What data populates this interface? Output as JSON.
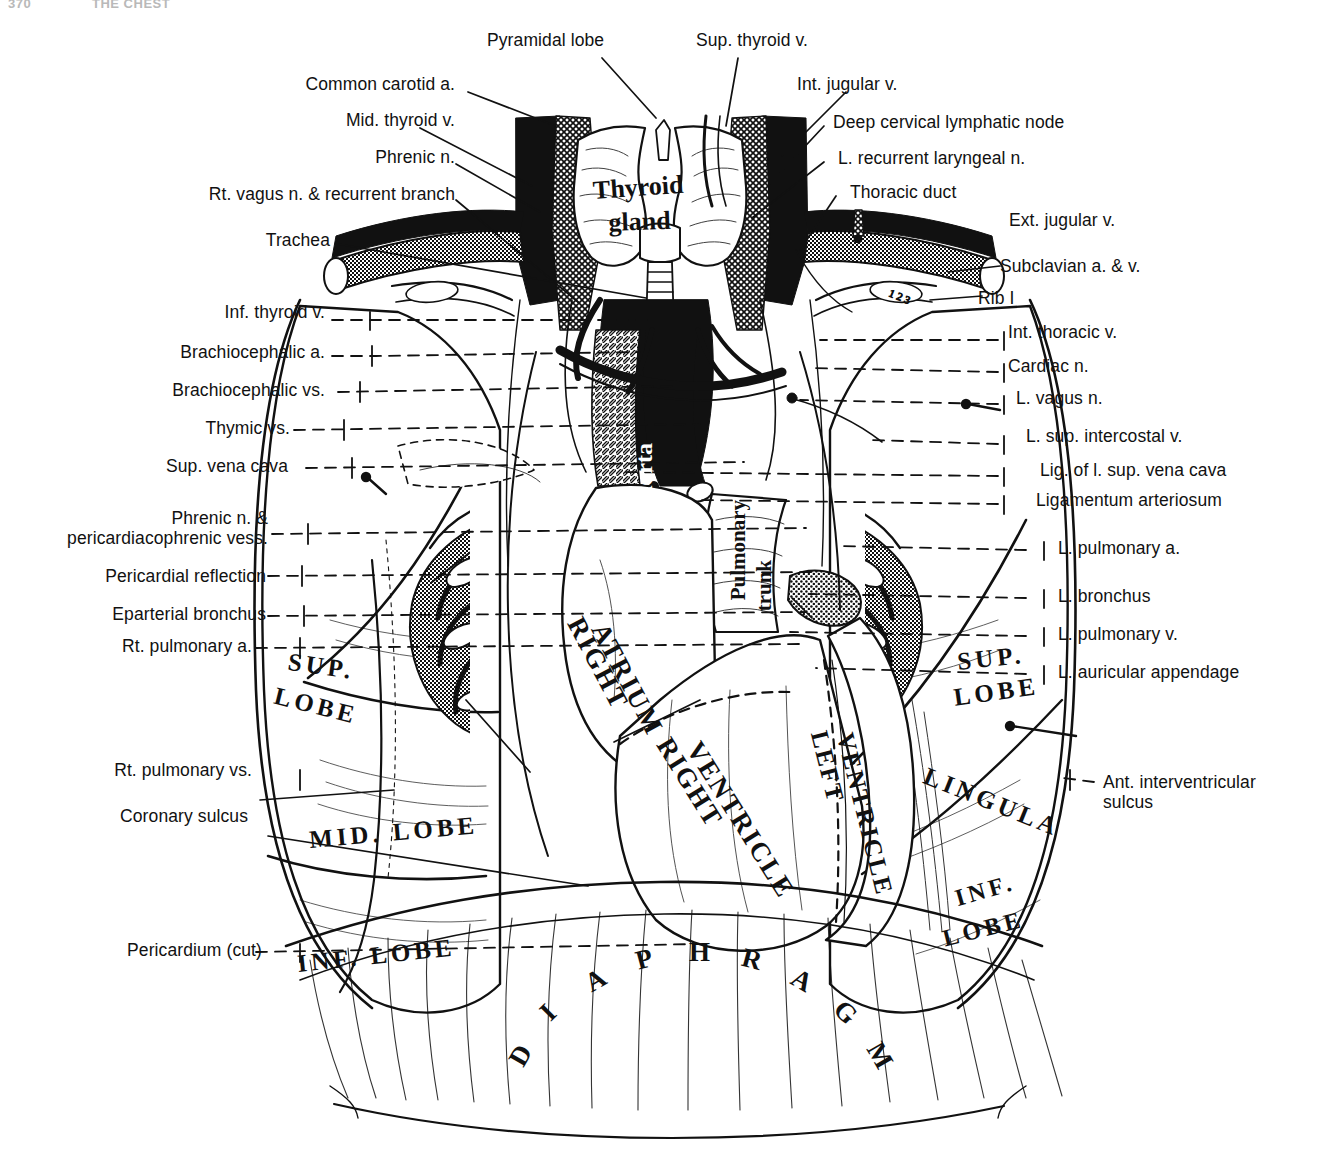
{
  "page_header": {
    "page_number": "370",
    "running_title": "THE CHEST"
  },
  "figure": {
    "ink_color": "#111111",
    "background_color": "#ffffff"
  },
  "labels_left": [
    {
      "id": "common-carotid-a",
      "text": "Common carotid a."
    },
    {
      "id": "mid-thyroid-v",
      "text": "Mid. thyroid v."
    },
    {
      "id": "phrenic-n",
      "text": "Phrenic n."
    },
    {
      "id": "rt-vagus-n",
      "text": "Rt. vagus n. & recurrent branch"
    },
    {
      "id": "trachea",
      "text": "Trachea"
    },
    {
      "id": "inf-thyroid-v",
      "text": "Inf. thyroid v."
    },
    {
      "id": "brachiocephalic-a",
      "text": "Brachiocephalic a."
    },
    {
      "id": "brachiocephalic-vs",
      "text": "Brachiocephalic vs."
    },
    {
      "id": "thymic-vs",
      "text": "Thymic vs."
    },
    {
      "id": "sup-vena-cava",
      "text": "Sup. vena cava"
    },
    {
      "id": "phrenic-n-pericardiacophrenic",
      "text": "Phrenic n. &\npericardiacophrenic vess."
    },
    {
      "id": "pericardial-reflection",
      "text": "Pericardial reflection"
    },
    {
      "id": "eparterial-bronchus",
      "text": "Eparterial bronchus"
    },
    {
      "id": "rt-pulmonary-a",
      "text": "Rt. pulmonary a."
    },
    {
      "id": "rt-pulmonary-vs",
      "text": "Rt. pulmonary vs."
    },
    {
      "id": "coronary-sulcus",
      "text": "Coronary sulcus"
    },
    {
      "id": "pericardium-cut",
      "text": "Pericardium (cut)"
    }
  ],
  "labels_top": [
    {
      "id": "pyramidal-lobe",
      "text": "Pyramidal lobe"
    },
    {
      "id": "sup-thyroid-v",
      "text": "Sup. thyroid v."
    },
    {
      "id": "int-jugular-v",
      "text": "Int. jugular v."
    }
  ],
  "labels_right": [
    {
      "id": "deep-cervical-lymphatic-node",
      "text": "Deep cervical lymphatic node"
    },
    {
      "id": "l-recurrent-laryngeal-n",
      "text": "L. recurrent laryngeal n."
    },
    {
      "id": "thoracic-duct",
      "text": "Thoracic duct"
    },
    {
      "id": "ext-jugular-v",
      "text": "Ext. jugular v."
    },
    {
      "id": "subclavian-a-v",
      "text": "Subclavian a. & v."
    },
    {
      "id": "rib-i",
      "text": "Rib I"
    },
    {
      "id": "int-thoracic-v",
      "text": "Int. thoracic v."
    },
    {
      "id": "cardiac-n",
      "text": "Cardiac n."
    },
    {
      "id": "l-vagus-n",
      "text": "L. vagus n."
    },
    {
      "id": "l-sup-intercostal-v",
      "text": "L. sup. intercostal v."
    },
    {
      "id": "lig-of-l-sup-vena-cava",
      "text": "Lig. of l. sup. vena cava"
    },
    {
      "id": "ligamentum-arteriosum",
      "text": "Ligamentum arteriosum"
    },
    {
      "id": "l-pulmonary-a",
      "text": "L. pulmonary a."
    },
    {
      "id": "l-bronchus",
      "text": "L. bronchus"
    },
    {
      "id": "l-pulmonary-v",
      "text": "L. pulmonary v."
    },
    {
      "id": "l-auricular-appendage",
      "text": "L. auricular appendage"
    },
    {
      "id": "ant-interventricular-sulcus",
      "text": "Ant. interventricular\nsulcus"
    }
  ],
  "anatomical_names": [
    {
      "id": "thyroid-gland-1",
      "text": "Thyroid",
      "style": "serif-bold-mixed"
    },
    {
      "id": "thyroid-gland-2",
      "text": "gland",
      "style": "serif-bold-mixed"
    },
    {
      "id": "aorta",
      "text": "Aorta",
      "style": "serif-bold-reversed"
    },
    {
      "id": "pulmonary-trunk-1",
      "text": "Pulmonary",
      "style": "serif-bold-mixed"
    },
    {
      "id": "pulmonary-trunk-2",
      "text": "trunk",
      "style": "serif-bold-mixed"
    },
    {
      "id": "right-atrium-1",
      "text": "RIGHT",
      "style": "serif-bold-caps"
    },
    {
      "id": "right-atrium-2",
      "text": "ATRIUM",
      "style": "serif-bold-caps"
    },
    {
      "id": "right-ventricle-1",
      "text": "RIGHT",
      "style": "serif-bold-caps"
    },
    {
      "id": "right-ventricle-2",
      "text": "VENTRICLE",
      "style": "serif-bold-caps"
    },
    {
      "id": "left-ventricle-1",
      "text": "LEFT",
      "style": "serif-bold-caps"
    },
    {
      "id": "left-ventricle-2",
      "text": "VENTRICLE",
      "style": "serif-bold-caps"
    },
    {
      "id": "rt-sup-lobe-1",
      "text": "SUP.",
      "style": "serif-bold-caps"
    },
    {
      "id": "rt-sup-lobe-2",
      "text": "LOBE",
      "style": "serif-bold-caps"
    },
    {
      "id": "rt-mid-lobe",
      "text": "MID. LOBE",
      "style": "serif-bold-caps"
    },
    {
      "id": "rt-inf-lobe",
      "text": "INF. LOBE",
      "style": "serif-bold-caps"
    },
    {
      "id": "lt-sup-lobe-1",
      "text": "SUP.",
      "style": "serif-bold-caps"
    },
    {
      "id": "lt-sup-lobe-2",
      "text": "LOBE",
      "style": "serif-bold-caps"
    },
    {
      "id": "lingula",
      "text": "LINGULA",
      "style": "serif-bold-caps"
    },
    {
      "id": "lt-inf-lobe-1",
      "text": "INF.",
      "style": "serif-bold-caps"
    },
    {
      "id": "lt-inf-lobe-2",
      "text": "LOBE",
      "style": "serif-bold-caps"
    },
    {
      "id": "diaphragm",
      "text": "DIAPHRAGM",
      "style": "serif-bold-caps-arched"
    }
  ]
}
